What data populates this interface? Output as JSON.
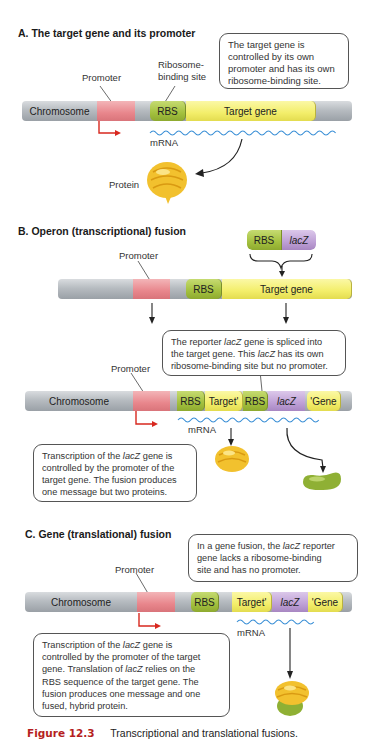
{
  "sections": {
    "a": {
      "title": "A. The target gene and its promoter",
      "labels": {
        "promoter": "Promoter",
        "rbs_site_line1": "Ribosome-",
        "rbs_site_line2": "binding site",
        "mrna": "mRNA",
        "protein": "Protein"
      },
      "bar": {
        "chromosome": "Chromosome",
        "rbs": "RBS",
        "target": "Target gene"
      },
      "callout": [
        "The target gene is",
        "controlled by its own",
        "promoter and has its own",
        "ribosome-binding site."
      ]
    },
    "b": {
      "title": "B. Operon (transcriptional) fusion",
      "insert": {
        "rbs": "RBS",
        "lacz": "lacZ"
      },
      "labels": {
        "promoter_top": "Promoter",
        "promoter_bottom": "Promoter",
        "mrna": "mRNA"
      },
      "bar_top": {
        "rbs": "RBS",
        "target": "Target gene"
      },
      "bar_bottom": {
        "chromosome": "Chromosome",
        "rbs1": "RBS",
        "target_prime": "Target'",
        "rbs2": "RBS",
        "lacz": "lacZ",
        "gene_prime": "'Gene"
      },
      "callout_top": [
        "The reporter lacZ gene is spliced into",
        "the target gene. This lacZ has its own",
        "ribosome-binding site but no promoter."
      ],
      "callout_bottom": [
        "Transcription of the lacZ gene is",
        "controlled by the promoter of the",
        "target gene. The fusion produces",
        "one message but two proteins."
      ]
    },
    "c": {
      "title": "C. Gene (translational) fusion",
      "labels": {
        "promoter": "Promoter",
        "mrna": "mRNA"
      },
      "bar": {
        "chromosome": "Chromosome",
        "rbs": "RBS",
        "target_prime": "Target'",
        "lacz": "lacZ",
        "gene_prime": "'Gene"
      },
      "callout_top": [
        "In a gene fusion, the lacZ reporter",
        "gene lacks a ribosome-binding",
        "site and has no promoter."
      ],
      "callout_bottom": [
        "Transcription of the lacZ gene is",
        "controlled by the promoter of the target",
        "gene. Translation of lacZ relies on the",
        "RBS sequence of the target gene. The",
        "fusion produces one message and one",
        "fused, hybrid protein."
      ]
    }
  },
  "caption": {
    "figure_number": "Figure 12.3",
    "text": "Transcriptional and translational fusions."
  },
  "colors": {
    "promoter": "#e8868c",
    "rbs": "#a3c03e",
    "target": "#f3ee6a",
    "lacz": "#bea0d6",
    "chromosome": "#b7bcc1",
    "mrna": "#3a8fd6",
    "arrow_promoter": "#d8281f",
    "caption_red": "#b51e21"
  }
}
